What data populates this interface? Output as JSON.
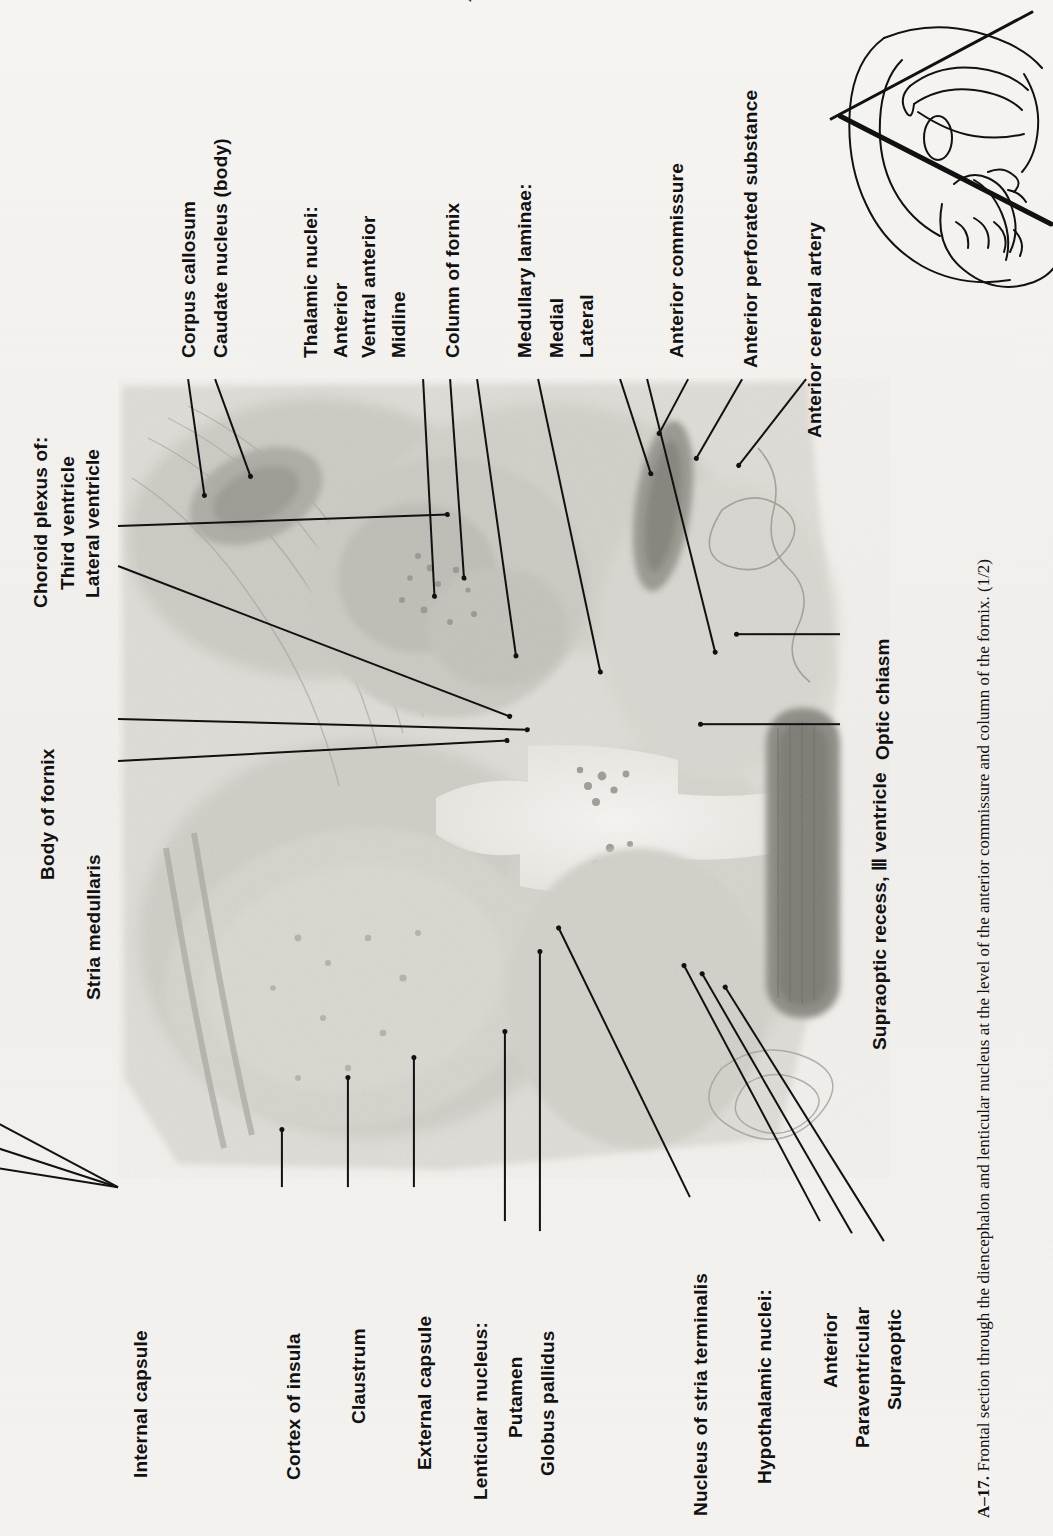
{
  "header": {
    "running_head": "ATLAS",
    "page_number": "693"
  },
  "figure": {
    "number": "A–17.",
    "caption": "Frontal section through the diencephalon and lenticular nucleus at the level of the anterior commissure and column of the fornix. (1/2)",
    "inset_name": "midsagittal-brain-plane-diagram"
  },
  "labels_top": [
    {
      "id": "corpus-callosum",
      "text": "Corpus callosum"
    },
    {
      "id": "caudate-nucleus-body",
      "text": "Caudate nucleus (body)"
    },
    {
      "id": "thalamic-nuclei",
      "text": "Thalamic nuclei:"
    },
    {
      "id": "thalamic-anterior",
      "text": "Anterior"
    },
    {
      "id": "thalamic-ventral-anterior",
      "text": "Ventral anterior"
    },
    {
      "id": "thalamic-midline",
      "text": "Midline"
    },
    {
      "id": "column-of-fornix",
      "text": "Column of fornix"
    },
    {
      "id": "medullary-laminae",
      "text": "Medullary laminae:"
    },
    {
      "id": "medullary-medial",
      "text": "Medial"
    },
    {
      "id": "medullary-lateral",
      "text": "Lateral"
    },
    {
      "id": "anterior-commissure",
      "text": "Anterior commissure"
    },
    {
      "id": "anterior-perforated-substance",
      "text": "Anterior perforated substance"
    },
    {
      "id": "anterior-cerebral-artery",
      "text": "Anterior cerebral artery"
    }
  ],
  "labels_left": [
    {
      "id": "choroid-plexus-of",
      "text": "Choroid plexus of:"
    },
    {
      "id": "third-ventricle",
      "text": "Third ventricle"
    },
    {
      "id": "lateral-ventricle",
      "text": "Lateral ventricle"
    },
    {
      "id": "body-of-fornix",
      "text": "Body of fornix"
    },
    {
      "id": "stria-medullaris",
      "text": "Stria medullaris"
    }
  ],
  "labels_right": [
    {
      "id": "optic-chiasm",
      "text": "Optic chiasm"
    },
    {
      "id": "supraoptic-recess",
      "text": "Supraoptic recess, Ⅲ ventricle"
    }
  ],
  "labels_bottom": [
    {
      "id": "internal-capsule",
      "text": "Internal capsule"
    },
    {
      "id": "cortex-of-insula",
      "text": "Cortex of insula"
    },
    {
      "id": "claustrum",
      "text": "Claustrum"
    },
    {
      "id": "external-capsule",
      "text": "External capsule"
    },
    {
      "id": "lenticular-nucleus",
      "text": "Lenticular nucleus:"
    },
    {
      "id": "putamen",
      "text": "Putamen"
    },
    {
      "id": "globus-pallidus",
      "text": "Globus pallidus"
    },
    {
      "id": "nucleus-of-stria-terminalis",
      "text": "Nucleus of stria terminalis"
    },
    {
      "id": "hypothalamic-nuclei",
      "text": "Hypothalamic nuclei:"
    },
    {
      "id": "hypothalamic-anterior",
      "text": "Anterior"
    },
    {
      "id": "hypothalamic-paraventricular",
      "text": "Paraventricular"
    },
    {
      "id": "hypothalamic-supraoptic",
      "text": "Supraoptic"
    }
  ],
  "colors": {
    "ink": "#111111",
    "paper": "#f3f2ef",
    "tissue_light": "#dcdad4",
    "tissue_mid": "#bfbdb6",
    "tissue_dark": "#8f8d87"
  }
}
